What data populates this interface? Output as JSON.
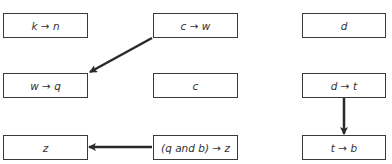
{
  "diagram": {
    "type": "dependency-graph",
    "nodes": [
      {
        "id": "n1",
        "label": "k → n",
        "x": 3,
        "y": 13,
        "w": 85,
        "h": 25
      },
      {
        "id": "n2",
        "label": "c → w",
        "x": 153,
        "y": 13,
        "w": 85,
        "h": 25
      },
      {
        "id": "n3",
        "label": "d",
        "x": 302,
        "y": 13,
        "w": 84,
        "h": 25
      },
      {
        "id": "n4",
        "label": "w → q",
        "x": 3,
        "y": 73,
        "w": 85,
        "h": 25
      },
      {
        "id": "n5",
        "label": "c",
        "x": 153,
        "y": 73,
        "w": 85,
        "h": 25
      },
      {
        "id": "n6",
        "label": "d → t",
        "x": 302,
        "y": 73,
        "w": 84,
        "h": 25
      },
      {
        "id": "n7",
        "label": "z",
        "x": 3,
        "y": 135,
        "w": 85,
        "h": 25
      },
      {
        "id": "n8",
        "label": "(q and b) → z",
        "x": 153,
        "y": 135,
        "w": 85,
        "h": 25
      },
      {
        "id": "n9",
        "label": "t → b",
        "x": 302,
        "y": 135,
        "w": 84,
        "h": 25
      }
    ],
    "edges": [
      {
        "from": "n2",
        "to": "n4",
        "x1": 152,
        "y1": 38,
        "x2": 90,
        "y2": 72
      },
      {
        "from": "n8",
        "to": "n7",
        "x1": 152,
        "y1": 147,
        "x2": 89,
        "y2": 147
      },
      {
        "from": "n6",
        "to": "n9",
        "x1": 344,
        "y1": 98,
        "x2": 344,
        "y2": 134
      }
    ],
    "colors": {
      "stroke": "#3a3a3a",
      "text": "#333333",
      "background": "#ffffff"
    }
  }
}
